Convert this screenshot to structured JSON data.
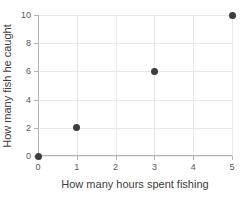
{
  "chart_data": {
    "type": "scatter",
    "title": "",
    "xlabel": "How many hours spent fishing",
    "ylabel": "How many fish he caught",
    "xlim": [
      0,
      5
    ],
    "ylim": [
      0,
      10
    ],
    "xticks": [
      "0",
      "1",
      "2",
      "3",
      "4",
      "5"
    ],
    "yticks": [
      "0",
      "2",
      "4",
      "6",
      "8",
      "10"
    ],
    "grid": true,
    "legend": false,
    "marker_color": "#3d3d3d",
    "gridline_color": "#e8e8e8",
    "axis_color": "#b4b4b4",
    "points": [
      {
        "x": 0,
        "y": 0
      },
      {
        "x": 1,
        "y": 2
      },
      {
        "x": 3,
        "y": 6
      },
      {
        "x": 5,
        "y": 10
      }
    ]
  }
}
